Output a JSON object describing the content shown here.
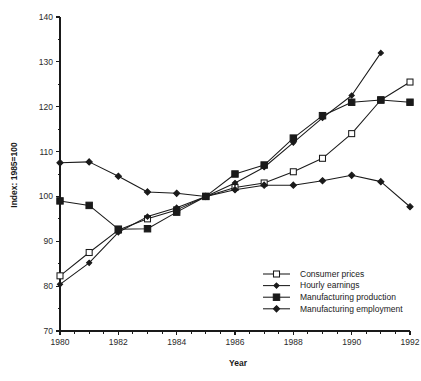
{
  "chart_data": {
    "type": "line",
    "title": "",
    "xlabel": "Year",
    "ylabel": "Index: 1985=100",
    "xlim": [
      1980,
      1992
    ],
    "ylim": [
      70,
      140
    ],
    "yticks": [
      70,
      80,
      90,
      100,
      110,
      120,
      130,
      140
    ],
    "xticks": [
      1980,
      1982,
      1984,
      1986,
      1988,
      1990,
      1992
    ],
    "x_minor_step": 0.5,
    "grid": false,
    "legend_position": "inside-bottom-right",
    "x": [
      1980,
      1981,
      1982,
      1983,
      1984,
      1985,
      1986,
      1987,
      1988,
      1989,
      1990,
      1991,
      1992
    ],
    "series": [
      {
        "name": "Consumer prices",
        "marker": "open-square",
        "values": [
          82.3,
          87.5,
          92.5,
          95.0,
          97.0,
          100.0,
          102.0,
          103.0,
          105.5,
          108.5,
          114.0,
          121.5,
          125.5
        ]
      },
      {
        "name": "Hourly earnings",
        "marker": "filled-diamond-small",
        "values": [
          80.4,
          85.2,
          92.0,
          95.5,
          97.5,
          100.0,
          103.0,
          106.5,
          112.0,
          117.5,
          122.5,
          132.0,
          null
        ]
      },
      {
        "name": "Manufacturing production",
        "marker": "filled-square",
        "values": [
          99.0,
          98.0,
          92.7,
          92.8,
          96.5,
          100.0,
          105.0,
          107.0,
          113.0,
          118.0,
          121.0,
          121.5,
          121.0
        ]
      },
      {
        "name": "Manufacturing employment",
        "marker": "filled-diamond",
        "values": [
          107.5,
          107.7,
          104.5,
          101.0,
          100.7,
          100.0,
          101.5,
          102.5,
          102.5,
          103.5,
          104.7,
          103.3,
          97.7
        ]
      }
    ]
  },
  "axes": {
    "y_label": "Index: 1985=100",
    "x_label": "Year",
    "y_tick_labels": [
      "70",
      "80",
      "90",
      "100",
      "110",
      "120",
      "130",
      "140"
    ],
    "x_tick_labels": [
      "1980",
      "1982",
      "1984",
      "1986",
      "1988",
      "1990",
      "1992"
    ]
  },
  "legend": {
    "entries": [
      {
        "label": "Consumer prices",
        "marker": "open-square"
      },
      {
        "label": "Hourly earnings",
        "marker": "filled-diamond-small"
      },
      {
        "label": "Manufacturing production",
        "marker": "filled-square"
      },
      {
        "label": "Manufacturing employment",
        "marker": "filled-diamond"
      }
    ]
  },
  "colors": {
    "ink": "#1a1a1a",
    "background": "#ffffff",
    "marker_fill_open": "#ffffff"
  }
}
